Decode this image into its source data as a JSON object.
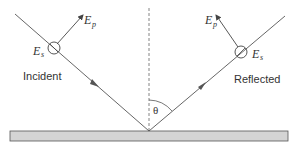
{
  "diagram": {
    "labels": {
      "incident": "Incident",
      "reflected": "Reflected",
      "angle": "θ"
    },
    "incident_field": {
      "ep_main": "E",
      "ep_sub": "p",
      "es_main": "E",
      "es_sub": "s"
    },
    "reflected_field": {
      "ep_main": "E",
      "ep_sub": "p",
      "es_main": "E",
      "es_sub": "s"
    },
    "colors": {
      "line": "#555555",
      "surface_fill": "#d4d4d4",
      "surface_stroke": "#555555",
      "text": "#333333"
    }
  }
}
